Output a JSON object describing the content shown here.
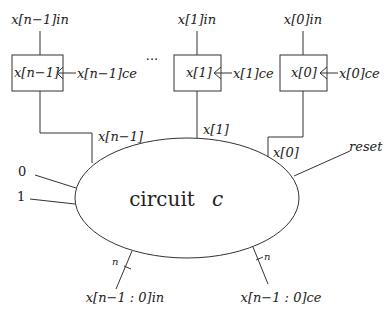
{
  "diagram": {
    "center_label": "circuit",
    "center_var": "c",
    "registers": [
      {
        "name": "x[n−1]",
        "in_label": "x[n−1]in",
        "ce_label": "x[n−1]ce",
        "out_label": "x[n−1]"
      },
      {
        "name": "x[1]",
        "in_label": "x[1]in",
        "ce_label": "x[1]ce",
        "out_label": "x[1]"
      },
      {
        "name": "x[0]",
        "in_label": "x[0]in",
        "ce_label": "x[0]ce",
        "out_label": "x[0]"
      }
    ],
    "ellipsis": "···",
    "constants": [
      "0",
      "1"
    ],
    "reset_label": "reset",
    "bus_outputs": [
      {
        "label": "x[n−1 : 0]in",
        "width": "n"
      },
      {
        "label": "x[n−1 : 0]ce",
        "width": "n"
      }
    ]
  }
}
